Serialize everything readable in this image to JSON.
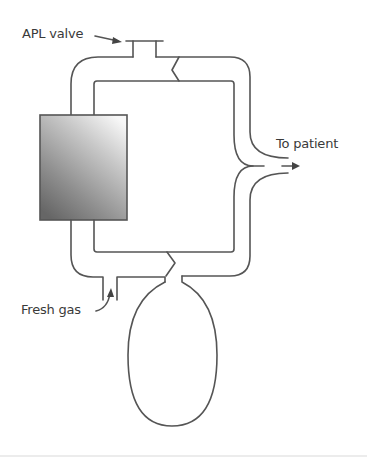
{
  "diagram": {
    "type": "breathing circuit schematic (circle system)",
    "labels": {
      "apl_valve": "APL valve",
      "to_patient": "To patient",
      "fresh_gas": "Fresh gas"
    },
    "components": [
      {
        "name": "APL valve",
        "position": "top"
      },
      {
        "name": "CO2 absorber canister",
        "position": "left"
      },
      {
        "name": "Y-piece to patient",
        "position": "right"
      },
      {
        "name": "Reservoir bag",
        "position": "bottom"
      },
      {
        "name": "Fresh gas inlet",
        "position": "lower-left"
      },
      {
        "name": "Unidirectional valves",
        "position": "top and bottom zigzag"
      }
    ],
    "colors": {
      "line": "#555555",
      "text": "#3a3a3a",
      "canister_light": "#f2f2f2",
      "canister_dark": "#6e6e6e"
    }
  }
}
